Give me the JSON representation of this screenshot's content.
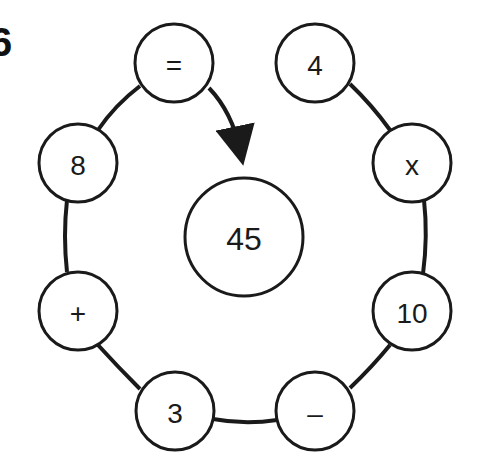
{
  "problem": {
    "number": "6"
  },
  "diagram": {
    "colors": {
      "stroke": "#1a1a1a",
      "fill": "#ffffff",
      "text": "#1a1a1a"
    },
    "center": {
      "label": "45",
      "cx": 244,
      "cy": 237,
      "r": 59
    },
    "arrow": {
      "from": "equals",
      "to": "center"
    },
    "nodes": [
      {
        "id": "equals",
        "label": "=",
        "cx": 174,
        "cy": 63,
        "r": 39
      },
      {
        "id": "four",
        "label": "4",
        "cx": 315,
        "cy": 63,
        "r": 39
      },
      {
        "id": "times",
        "label": "x",
        "cx": 412,
        "cy": 163,
        "r": 39
      },
      {
        "id": "ten",
        "label": "10",
        "cx": 412,
        "cy": 311,
        "r": 39
      },
      {
        "id": "minus",
        "label": "–",
        "cx": 315,
        "cy": 411,
        "r": 39
      },
      {
        "id": "three",
        "label": "3",
        "cx": 175,
        "cy": 411,
        "r": 39
      },
      {
        "id": "plus",
        "label": "+",
        "cx": 78,
        "cy": 311,
        "r": 39
      },
      {
        "id": "eight",
        "label": "8",
        "cx": 78,
        "cy": 163,
        "r": 39
      }
    ]
  }
}
